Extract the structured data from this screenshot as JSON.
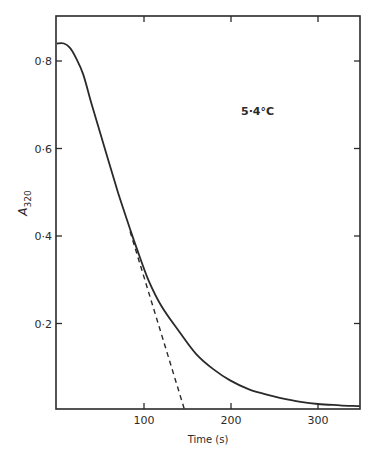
{
  "chart_data": {
    "type": "line",
    "title": "",
    "xlabel": "Time (s)",
    "ylabel": "A320",
    "ylabel_main": "A",
    "ylabel_sub": "320",
    "xlim": [
      0,
      350
    ],
    "ylim": [
      0,
      0.9
    ],
    "x_ticks": [
      100,
      200,
      300
    ],
    "x_tick_labels": [
      "100",
      "200",
      "300"
    ],
    "y_ticks": [
      0.2,
      0.4,
      0.6,
      0.8
    ],
    "y_tick_labels": [
      "0·2",
      "0·4",
      "0·6",
      "0·8"
    ],
    "grid": false,
    "legend": null,
    "annotations": [
      {
        "text": "5·4°C",
        "x": 210,
        "y": 0.69
      }
    ],
    "series": [
      {
        "name": "absorbance",
        "style": "solid",
        "x": [
          0,
          8,
          15,
          21,
          30,
          40,
          55,
          70,
          85,
          92,
          105,
          120,
          141,
          160,
          180,
          199,
          220,
          240,
          256,
          280,
          300,
          325,
          348
        ],
        "y": [
          0.84,
          0.84,
          0.83,
          0.81,
          0.77,
          0.7,
          0.6,
          0.5,
          0.41,
          0.37,
          0.3,
          0.24,
          0.18,
          0.13,
          0.095,
          0.07,
          0.05,
          0.038,
          0.03,
          0.021,
          0.016,
          0.013,
          0.011
        ]
      },
      {
        "name": "initial-rate extrapolation",
        "style": "dashed",
        "x": [
          84,
          147
        ],
        "y": [
          0.41,
          0.0
        ]
      }
    ]
  }
}
